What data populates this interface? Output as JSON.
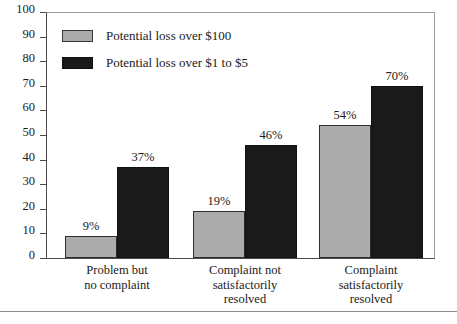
{
  "chart_data": {
    "type": "bar",
    "title": "",
    "subtitle": "",
    "xlabel": "",
    "ylabel": "",
    "ylim": [
      0,
      100
    ],
    "yticks": [
      0,
      10,
      20,
      30,
      40,
      50,
      60,
      70,
      80,
      90,
      100
    ],
    "ytick_labels": [
      "0",
      "10",
      "20",
      "30",
      "40",
      "50",
      "60",
      "70",
      "80",
      "90",
      "100"
    ],
    "grid": false,
    "legend_position": "top-left inside plot area",
    "value_label_suffix": "%",
    "categories": [
      "Problem but no complaint",
      "Complaint not satisfactorily resolved",
      "Complaint satisfactorily resolved"
    ],
    "category_label_lines": [
      [
        "Problem but",
        "no complaint"
      ],
      [
        "Complaint not",
        "satisfactorily",
        "resolved"
      ],
      [
        "Complaint",
        "satisfactorily",
        "resolved"
      ]
    ],
    "series": [
      {
        "name": "Potential loss over $100",
        "color": "#ababab",
        "values": [
          9,
          19,
          54
        ],
        "value_labels": [
          "9%",
          "19%",
          "54%"
        ]
      },
      {
        "name": "Potential loss over $1 to $5",
        "color": "#1a1a1a",
        "values": [
          37,
          46,
          70
        ],
        "value_labels": [
          "37%",
          "46%",
          "70%"
        ]
      }
    ]
  },
  "legend": {
    "items": [
      {
        "label": "Potential loss over $100",
        "swatch": "series-a"
      },
      {
        "label": "Potential loss over $1 to $5",
        "swatch": "series-b"
      }
    ]
  },
  "axis": {
    "y_ticks": [
      {
        "label": "100"
      },
      {
        "label": "90"
      },
      {
        "label": "80"
      },
      {
        "label": "70"
      },
      {
        "label": "60"
      },
      {
        "label": "50"
      },
      {
        "label": "40"
      },
      {
        "label": "30"
      },
      {
        "label": "20"
      },
      {
        "label": "10"
      },
      {
        "label": "0"
      }
    ]
  },
  "colors": {
    "series_a": "#ababab",
    "series_b": "#1a1a1a",
    "axis": "#4a4a4a",
    "frame": "#9a9a9a",
    "text": "#1a1a1a",
    "background": "#ffffff"
  }
}
